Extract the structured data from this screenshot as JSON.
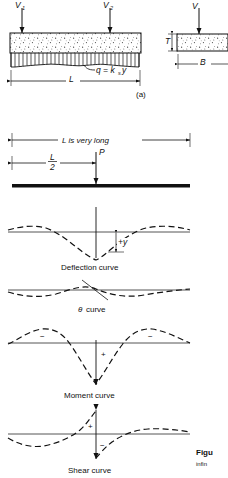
{
  "figure": {
    "panel_a": {
      "label": "(a)",
      "load_left": "V",
      "load_left_sub": "1",
      "load_right": "V",
      "load_right_sub": "2",
      "soil_reaction": "q = k",
      "soil_reaction_sub": "s",
      "soil_reaction_tail": "y",
      "span_label": "L",
      "section_load": "V",
      "section_thickness": "T",
      "section_width": "B"
    },
    "panel_b": {
      "length_note": "L is very long",
      "half_span_numerator": "L",
      "half_span_denominator": "2",
      "point_load": "P"
    },
    "curves": [
      {
        "name": "deflection-curve",
        "caption": "Deflection curve",
        "annotation": "+y",
        "signs": []
      },
      {
        "name": "theta-curve",
        "caption_symbol": "θ",
        "caption": " curve",
        "annotation": "",
        "signs": []
      },
      {
        "name": "moment-curve",
        "caption": "Moment curve",
        "annotation": "",
        "signs": [
          "−",
          "+",
          "−"
        ]
      },
      {
        "name": "shear-curve",
        "caption": "Shear curve",
        "annotation": "",
        "signs": [
          "+",
          "−"
        ]
      }
    ],
    "figure_caption": "Figu",
    "figure_caption_sub": "infin"
  },
  "colors": {
    "ink": "#111111",
    "rule": "#555555",
    "stipple": "#444444",
    "background": "#ffffff"
  }
}
